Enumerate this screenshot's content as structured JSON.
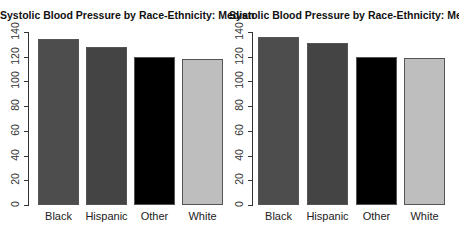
{
  "chart_data": [
    {
      "type": "bar",
      "title": "Systolic Blood Pressure by Race-Ethnicity: Median",
      "categories": [
        "Black",
        "Hispanic",
        "Other",
        "White"
      ],
      "values": [
        134,
        128,
        120,
        118
      ],
      "colors": [
        "#4d4d4d",
        "#444444",
        "#000000",
        "#bebebe"
      ],
      "xlabel": "",
      "ylabel": "",
      "ylim": [
        0,
        140
      ],
      "yticks": [
        0,
        20,
        40,
        60,
        80,
        100,
        120,
        140
      ],
      "grid": false,
      "legend": null
    },
    {
      "type": "bar",
      "title": "Systolic Blood Pressure by Race-Ethnicity: Mean",
      "categories": [
        "Black",
        "Hispanic",
        "Other",
        "White"
      ],
      "values": [
        136,
        131,
        120,
        119
      ],
      "colors": [
        "#4d4d4d",
        "#444444",
        "#000000",
        "#bebebe"
      ],
      "xlabel": "",
      "ylabel": "",
      "ylim": [
        0,
        140
      ],
      "yticks": [
        0,
        20,
        40,
        60,
        80,
        100,
        120,
        140
      ],
      "grid": false,
      "legend": null
    }
  ]
}
